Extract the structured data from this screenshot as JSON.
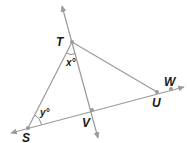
{
  "diagram": {
    "type": "geometry-figure",
    "points": {
      "T": {
        "label": "T",
        "x": 72,
        "y": 42
      },
      "S": {
        "label": "S",
        "x": 28,
        "y": 128
      },
      "U": {
        "label": "U",
        "x": 157,
        "y": 92
      },
      "W": {
        "label": "W",
        "x": 171,
        "y": 89
      },
      "V": {
        "label": "V",
        "x": 92,
        "y": 110
      }
    },
    "angles": {
      "x": {
        "label": "x°",
        "vertex": "T"
      },
      "y": {
        "label": "y°",
        "vertex": "S"
      }
    },
    "lines": [
      {
        "name": "line-TV",
        "from": "T",
        "to": "V",
        "extends": "both"
      },
      {
        "name": "line-SW",
        "from": "S",
        "to": "W",
        "extends": "both"
      }
    ],
    "segments": [
      {
        "name": "segment-ST",
        "from": "S",
        "to": "T"
      },
      {
        "name": "segment-TU",
        "from": "T",
        "to": "U"
      }
    ],
    "colors": {
      "line": "#9a9a9a",
      "label": "#1a1a1a"
    }
  }
}
